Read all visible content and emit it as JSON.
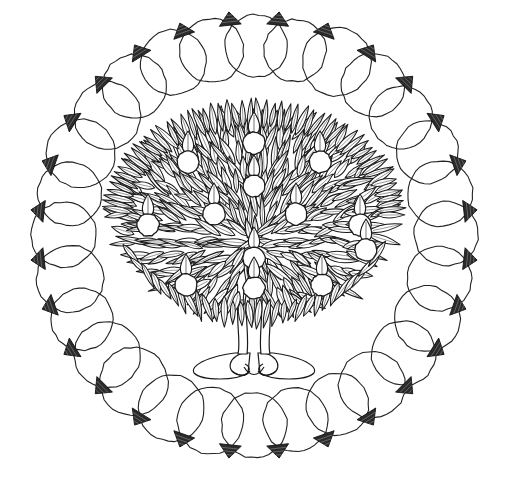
{
  "artwork": {
    "title": "Mandala Tree Coloring Page",
    "subject": "tree-of-life-mandala",
    "style": "black-and-white line drawing",
    "medium": "hand-drawn ink outline",
    "background_color": "#ffffff",
    "line_color": "#1a1a1a",
    "canvas": {
      "width": 508,
      "height": 484
    },
    "center": {
      "x": 254,
      "y": 235
    }
  },
  "border_ring": {
    "name": "overlapping-circle-border",
    "circle_count": 28,
    "circle_radius": 33,
    "ring_radius": 190,
    "wedge_count": 28,
    "wedge_style": "hatched-triangle",
    "wedge_fill": "#2b2b2b",
    "stroke_color": "#222222",
    "stroke_width": 1.1
  },
  "tree": {
    "name": "fruit-tree",
    "canopy": {
      "center_x": 254,
      "center_y": 215,
      "radius_x": 133,
      "radius_y": 97,
      "top_y": 118,
      "bottom_y": 308,
      "left_x": 121,
      "right_x": 387,
      "leaf_count": 420,
      "leaf_shape": "pointed-oval",
      "fill": "#ffffff"
    },
    "fruits": {
      "count": 13,
      "shape": "round-apple-with-pointed-leaf",
      "radius": 11,
      "positions": [
        {
          "x": 254,
          "y": 143
        },
        {
          "x": 188,
          "y": 162
        },
        {
          "x": 320,
          "y": 162
        },
        {
          "x": 254,
          "y": 186
        },
        {
          "x": 148,
          "y": 225
        },
        {
          "x": 214,
          "y": 214
        },
        {
          "x": 296,
          "y": 214
        },
        {
          "x": 360,
          "y": 225
        },
        {
          "x": 254,
          "y": 258
        },
        {
          "x": 186,
          "y": 285
        },
        {
          "x": 322,
          "y": 285
        },
        {
          "x": 254,
          "y": 288
        },
        {
          "x": 366,
          "y": 250
        }
      ]
    },
    "trunk": {
      "top_y": 300,
      "base_y": 358,
      "split": true,
      "left_branch_x": 240,
      "right_branch_x": 268,
      "width": 9
    },
    "roots": {
      "name": "curled-root-base",
      "loop_count": 4,
      "center_x": 254,
      "y": 365,
      "spread": 66,
      "style": "interlocking-curls"
    }
  },
  "palette": {
    "paper": "#ffffff",
    "ink": "#1a1a1a",
    "ink_light": "#444444",
    "wedge": "#2b2b2b"
  }
}
